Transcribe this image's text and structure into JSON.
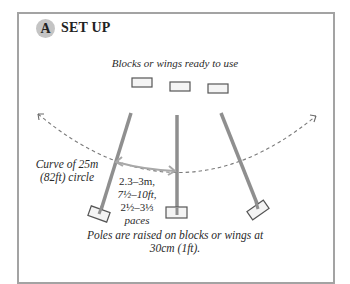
{
  "panel": {
    "badge_letter": "A",
    "title": "SET UP",
    "border_color": "#a3a3a3",
    "badge_color": "#c4c4c4"
  },
  "diagram": {
    "blocks_label": "Blocks or wings ready to use",
    "curve_label_line1": "Curve of 25m",
    "curve_label_line2": "(82ft) circle",
    "distance_line1": "2.3–3m,",
    "distance_line2": "7½–10ft,",
    "distance_line3": "2½–3⅓",
    "distance_line4": "paces",
    "poles_note_line1": "Poles are raised on blocks or wings at",
    "poles_note_line2": "30cm (1ft).",
    "pole_color": "#8f8f8f",
    "arrow_color": "#a8a8a8",
    "curve_color": "#7a7a7a"
  }
}
